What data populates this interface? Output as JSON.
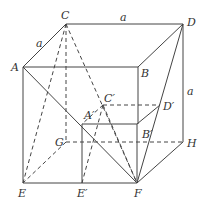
{
  "diagram": {
    "points": {
      "A": "A",
      "B": "B",
      "C": "C",
      "D": "D",
      "E": "E",
      "F": "F",
      "G": "G",
      "H": "H",
      "A1": "A′",
      "B1": "B′",
      "C1": "C′",
      "D1": "D′",
      "E1": "E′"
    },
    "edge_labels": {
      "ac": "a",
      "cd": "a",
      "dh": "a"
    },
    "colors": {
      "line": "#444444",
      "text": "#333333"
    }
  }
}
